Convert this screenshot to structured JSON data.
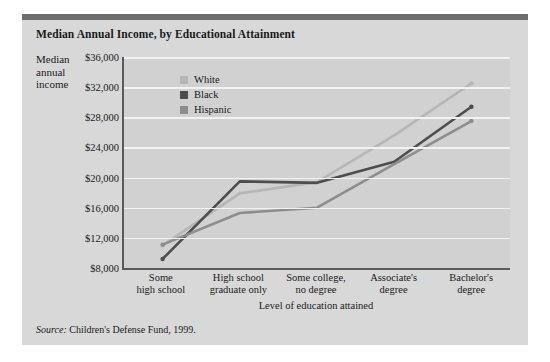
{
  "figure": {
    "title": "Median Annual Income, by Educational Attainment",
    "y_axis_label": "Median annual income",
    "source_label": "Source:",
    "source_text": " Children's Defense Fund, 1999."
  },
  "colors": {
    "white_series": "#b6b6b6",
    "black_series": "#4d4d4d",
    "hispanic_series": "#8d8d8d",
    "plot_background": "#d1d1d1",
    "card_background": "#d8d8d8",
    "top_rule": "#6e6e6e",
    "gridline": "#f2f2f2",
    "axis": "#5a5a5a"
  },
  "chart_data": {
    "type": "line",
    "title": "Median Annual Income, by Educational Attainment",
    "xlabel": "Level of education attained",
    "ylabel": "Median annual income",
    "categories": [
      "Some high school",
      "High school graduate only",
      "Some college, no degree",
      "Associate's degree",
      "Bachelor's degree"
    ],
    "category_lines": [
      [
        "Some",
        "high school"
      ],
      [
        "High school",
        "graduate only"
      ],
      [
        "Some college,",
        "no degree"
      ],
      [
        "Associate's",
        "degree"
      ],
      [
        "Bachelor's",
        "degree"
      ]
    ],
    "ylim": [
      8000,
      36000
    ],
    "yticks": [
      36000,
      32000,
      28000,
      24000,
      20000,
      16000,
      12000,
      8000
    ],
    "ytick_labels": [
      "$36,000",
      "$32,000",
      "$28,000",
      "$24,000",
      "$20,000",
      "$16,000",
      "$12,000",
      "$8,000"
    ],
    "grid": true,
    "legend_position": "upper-left-inside",
    "series": [
      {
        "name": "White",
        "color": "#b6b6b6",
        "values": [
          11000,
          17900,
          19400,
          25600,
          32500
        ]
      },
      {
        "name": "Black",
        "color": "#4d4d4d",
        "values": [
          9200,
          19500,
          19300,
          22100,
          29400
        ]
      },
      {
        "name": "Hispanic",
        "color": "#8d8d8d",
        "values": [
          11100,
          15300,
          16000,
          21800,
          27500
        ]
      }
    ]
  }
}
